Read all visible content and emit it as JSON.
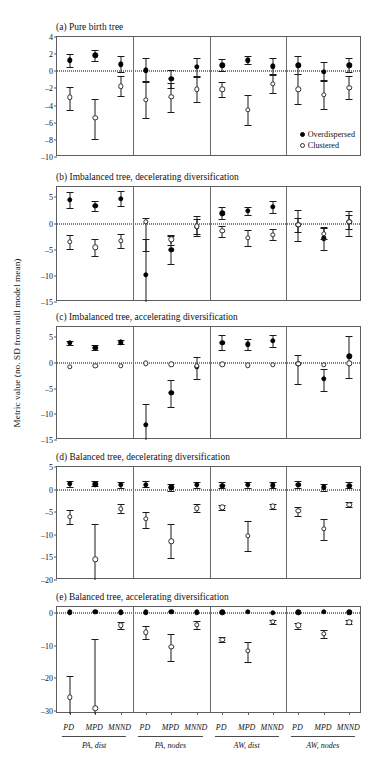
{
  "figure": {
    "ylabel": "Metric value (no. SD from null model mean)",
    "legend": [
      {
        "key": "overdispersed",
        "label": "Overdispersed",
        "marker": "filled-circle"
      },
      {
        "key": "clustered",
        "label": "Clustered",
        "marker": "open-circle"
      }
    ],
    "groups": [
      {
        "label": "PA, dist",
        "metrics": [
          "PD",
          "MPD",
          "MNND"
        ]
      },
      {
        "label": "PA, nodes",
        "metrics": [
          "PD",
          "MPD",
          "MNND"
        ]
      },
      {
        "label": "AW, dist",
        "metrics": [
          "PD",
          "MPD",
          "MNND"
        ]
      },
      {
        "label": "AW, nodes",
        "metrics": [
          "PD",
          "MPD",
          "MNND"
        ]
      }
    ]
  },
  "chart_data": {
    "type": "scatter",
    "title": "",
    "xlabel": "",
    "ylabel": "Metric value (no. SD from null model mean)",
    "grid": false,
    "legend_position": "inside-bottom-right-of-panel-a",
    "x_categories": [
      "PA, dist / PD",
      "PA, dist / MPD",
      "PA, dist / MNND",
      "PA, nodes / PD",
      "PA, nodes / MPD",
      "PA, nodes / MNND",
      "AW, dist / PD",
      "AW, dist / MPD",
      "AW, dist / MNND",
      "AW, nodes / PD",
      "AW, nodes / MPD",
      "AW, nodes / MNND"
    ],
    "panels": [
      {
        "id": "a",
        "title": "(a) Pure birth tree",
        "ylim": [
          -10,
          4
        ],
        "yticks": [
          4,
          2,
          0,
          -2,
          -4,
          -6,
          -8,
          -10
        ],
        "series": [
          {
            "name": "Overdispersed",
            "marker": "filled-circle",
            "values": [
              1.3,
              1.85,
              0.8,
              0.1,
              -0.85,
              0.5,
              0.7,
              1.3,
              0.6,
              0.7,
              -0.05,
              0.7
            ],
            "lower": [
              0.55,
              1.2,
              -0.1,
              -1.25,
              -1.9,
              -0.55,
              0.0,
              0.85,
              -0.35,
              -0.35,
              -1.1,
              -0.1
            ],
            "upper": [
              2.0,
              2.5,
              1.75,
              1.5,
              0.2,
              1.6,
              1.45,
              1.75,
              1.55,
              1.8,
              1.05,
              1.55
            ]
          },
          {
            "name": "Clustered",
            "marker": "open-circle",
            "values": [
              -3.05,
              -5.4,
              -1.75,
              -3.35,
              -2.95,
              -2.1,
              -2.1,
              -4.5,
              -1.45,
              -2.1,
              -2.75,
              -1.9
            ],
            "lower": [
              -4.5,
              -7.9,
              -2.85,
              -5.5,
              -4.7,
              -3.6,
              -3.05,
              -6.3,
              -2.5,
              -3.85,
              -4.45,
              -3.2
            ],
            "upper": [
              -1.85,
              -3.2,
              -0.6,
              -1.15,
              -1.4,
              -0.65,
              -1.2,
              -2.75,
              -0.45,
              -0.35,
              -1.05,
              -0.5
            ]
          }
        ]
      },
      {
        "id": "b",
        "title": "(b) Imbalanced tree, decelerating diversification",
        "ylim": [
          -15,
          7
        ],
        "yticks": [
          5,
          0,
          -5,
          -10,
          -15
        ],
        "series": [
          {
            "name": "Overdispersed",
            "marker": "filled-circle",
            "values": [
              4.5,
              3.4,
              4.8,
              -9.8,
              -5.0,
              -0.6,
              2.0,
              2.4,
              3.2,
              -0.2,
              -2.8,
              0.3
            ],
            "lower": [
              2.9,
              2.4,
              3.3,
              -15.5,
              -7.7,
              -2.4,
              0.9,
              1.6,
              2.1,
              -3.3,
              -5.0,
              -2.3
            ],
            "upper": [
              6.0,
              4.4,
              6.3,
              -3.0,
              -2.3,
              1.4,
              3.2,
              3.2,
              4.3,
              2.6,
              -0.6,
              2.5
            ]
          },
          {
            "name": "Clustered",
            "marker": "open-circle",
            "values": [
              -3.5,
              -4.5,
              -3.3,
              0.4,
              -3.0,
              -0.5,
              -1.4,
              -2.7,
              -2.1,
              -0.25,
              -1.9,
              0.35
            ],
            "lower": [
              -4.9,
              -6.2,
              -4.6,
              -5.2,
              -4.0,
              -1.9,
              -2.5,
              -4.2,
              -3.1,
              -1.6,
              -3.0,
              -1.0
            ],
            "upper": [
              -2.2,
              -2.9,
              -2.0,
              1.0,
              -2.1,
              0.9,
              -0.4,
              -1.3,
              -1.0,
              1.1,
              -0.8,
              1.6
            ]
          }
        ]
      },
      {
        "id": "c",
        "title": "(c) Imbalanced tree, accelerating diversification",
        "ylim": [
          -15,
          7
        ],
        "yticks": [
          5,
          0,
          -5,
          -10,
          -15
        ],
        "series": [
          {
            "name": "Overdispersed",
            "marker": "filled-circle",
            "values": [
              3.9,
              3.0,
              4.0,
              -12.0,
              -5.8,
              -0.7,
              3.9,
              3.6,
              4.3,
              -0.2,
              -3.1,
              1.3
            ],
            "lower": [
              3.4,
              2.6,
              3.6,
              -16.0,
              -8.6,
              -3.1,
              2.6,
              2.6,
              3.1,
              -4.0,
              -5.4,
              -2.9
            ],
            "upper": [
              4.3,
              3.5,
              4.5,
              -8.0,
              -3.4,
              1.2,
              5.4,
              4.7,
              5.5,
              1.5,
              -1.2,
              5.3
            ]
          },
          {
            "name": "Clustered",
            "marker": "open-circle",
            "values": [
              -0.7,
              -0.6,
              -0.6,
              -0.05,
              -0.3,
              -0.55,
              -0.3,
              -0.45,
              -0.35,
              -0.15,
              -0.35,
              -0.1
            ]
          }
        ]
      },
      {
        "id": "d",
        "title": "(d) Balanced tree, decelerating diversification",
        "ylim": [
          -20,
          5
        ],
        "yticks": [
          5,
          0,
          -5,
          -10,
          -15,
          -20
        ],
        "series": [
          {
            "name": "Overdispersed",
            "marker": "filled-circle",
            "values": [
              1.3,
              1.2,
              1.0,
              1.1,
              0.5,
              1.0,
              0.9,
              1.0,
              0.95,
              1.0,
              0.55,
              0.9
            ],
            "lower": [
              0.5,
              0.7,
              0.3,
              0.5,
              -0.3,
              0.3,
              0.3,
              0.4,
              0.35,
              0.3,
              -0.2,
              0.3
            ],
            "upper": [
              2.0,
              1.8,
              1.7,
              1.8,
              1.3,
              1.7,
              1.6,
              1.7,
              1.6,
              1.8,
              1.3,
              1.6
            ]
          },
          {
            "name": "Clustered",
            "marker": "open-circle",
            "values": [
              -6.0,
              -15.4,
              -4.2,
              -6.5,
              -11.4,
              -4.1,
              -3.9,
              -10.2,
              -3.7,
              -4.7,
              -8.7,
              -3.3
            ],
            "lower": [
              -7.7,
              -20.5,
              -5.1,
              -8.5,
              -15.2,
              -4.9,
              -4.5,
              -13.5,
              -4.3,
              -5.8,
              -11.1,
              -3.9
            ],
            "upper": [
              -4.5,
              -7.7,
              -3.2,
              -5.0,
              -7.5,
              -3.2,
              -3.3,
              -7.0,
              -3.1,
              -3.8,
              -6.5,
              -2.8
            ]
          }
        ]
      },
      {
        "id": "e",
        "title": "(e) Balanced tree, accelerating diversification",
        "ylim": [
          -31,
          2
        ],
        "yticks": [
          0,
          -10,
          -20,
          -30
        ],
        "series": [
          {
            "name": "Overdispersed",
            "marker": "filled-circle",
            "values": [
              0.4,
              0.5,
              0.35,
              0.4,
              0.45,
              0.4,
              0.35,
              0.5,
              0.3,
              0.4,
              0.45,
              0.35
            ]
          },
          {
            "name": "Clustered",
            "marker": "open-circle",
            "values": [
              -25.8,
              -29.2,
              -3.6,
              -5.8,
              -10.2,
              -3.5,
              -8.1,
              -11.6,
              -2.6,
              -3.7,
              -6.2,
              -2.7
            ],
            "lower": [
              -31.5,
              -32.5,
              -4.7,
              -7.9,
              -14.8,
              -4.7,
              -8.9,
              -15.0,
              -3.2,
              -4.8,
              -7.6,
              -3.3
            ],
            "upper": [
              -19.2,
              -7.9,
              -2.6,
              -3.9,
              -6.2,
              -2.4,
              -7.3,
              -8.8,
              -2.1,
              -2.8,
              -5.0,
              -2.1
            ]
          }
        ]
      }
    ]
  }
}
